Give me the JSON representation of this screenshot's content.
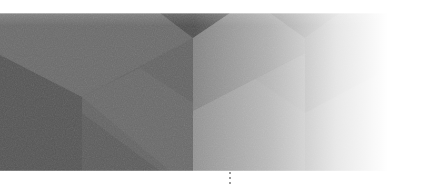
{
  "banner": {
    "kind": "decorative-geometric-header",
    "style": "grayscale isometric low-poly facets fading to white on the right",
    "band": {
      "top": 13,
      "bottom": 171
    },
    "colors": {
      "background": "#ffffff",
      "facet_darkest": "#4f4f4f",
      "facet_dark": "#5c5c5c",
      "facet_mid_dark": "#646464",
      "facet_mid": "#6e6e6e",
      "facet_mid_light": "#7c7c7c",
      "facet_light": "#8c8c8c",
      "facet_lighter": "#9a9a9a",
      "fade_to": "#ffffff",
      "dot_mark": "#7a7a7a"
    }
  },
  "scroll_hint": {
    "dots": 3
  }
}
